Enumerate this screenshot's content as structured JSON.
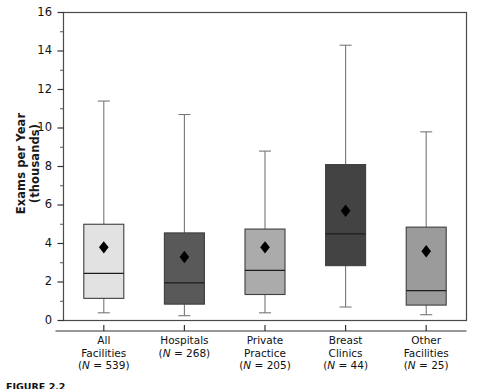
{
  "figure": {
    "ylabel_line1": "Exams per Year",
    "ylabel_line2": "(thousands)",
    "caption": "FIGURE 2.2"
  },
  "chart_data": {
    "type": "box",
    "title": "",
    "xlabel": "",
    "ylabel": "Exams per Year (thousands)",
    "ylim": [
      0,
      16
    ],
    "yticks": [
      0,
      2,
      4,
      6,
      8,
      10,
      12,
      14,
      16
    ],
    "ytick_labels": [
      "0",
      "2",
      "4",
      "6",
      "8",
      "10",
      "12",
      "14",
      "16"
    ],
    "minor_yticks": [
      1,
      3,
      5,
      7,
      9,
      11,
      13,
      15
    ],
    "grid": false,
    "legend": "none",
    "categories": [
      "All Facilities (N = 539)",
      "Hospitals (N = 268)",
      "Private Practice (N = 205)",
      "Breast Clinics (N = 44)",
      "Other Facilities (N = 25)"
    ],
    "category_labels": [
      {
        "line1": "All",
        "line2": "Facilities",
        "line3": "(N = 539)"
      },
      {
        "line1": "Hospitals",
        "line2": "(N = 268)",
        "line3": ""
      },
      {
        "line1": "Private",
        "line2": "Practice",
        "line3": "(N = 205)"
      },
      {
        "line1": "Breast",
        "line2": "Clinics",
        "line3": "(N = 44)"
      },
      {
        "line1": "Other",
        "line2": "Facilities",
        "line3": "(N = 25)"
      }
    ],
    "boxes": [
      {
        "name": "All Facilities",
        "n": 539,
        "whisker_low": 0.4,
        "q1": 1.15,
        "median": 2.45,
        "q3": 5.0,
        "whisker_high": 11.4,
        "mean": 3.8,
        "fill": "#e2e2e2"
      },
      {
        "name": "Hospitals",
        "n": 268,
        "whisker_low": 0.25,
        "q1": 0.85,
        "median": 1.95,
        "q3": 4.55,
        "whisker_high": 10.7,
        "mean": 3.3,
        "fill": "#595959"
      },
      {
        "name": "Private Practice",
        "n": 205,
        "whisker_low": 0.4,
        "q1": 1.35,
        "median": 2.6,
        "q3": 4.75,
        "whisker_high": 8.8,
        "mean": 3.8,
        "fill": "#ababab"
      },
      {
        "name": "Breast Clinics",
        "n": 44,
        "whisker_low": 0.7,
        "q1": 2.85,
        "median": 4.5,
        "q3": 8.1,
        "whisker_high": 14.3,
        "mean": 5.7,
        "fill": "#434343"
      },
      {
        "name": "Other Facilities",
        "n": 25,
        "whisker_low": 0.3,
        "q1": 0.8,
        "median": 1.55,
        "q3": 4.85,
        "whisker_high": 9.8,
        "mean": 3.6,
        "fill": "#9b9b9b"
      }
    ],
    "marker": {
      "mean": "diamond",
      "mean_color": "#000000"
    }
  }
}
